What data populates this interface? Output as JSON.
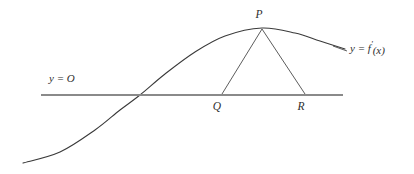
{
  "figure": {
    "title": "",
    "background_color": "#ffffff",
    "curve_color": "#3a3a3a",
    "axis_color": "#8a8a8a",
    "triangle_color": "#4a4a4a",
    "text_color": "#2e2e2e",
    "labels": {
      "axis_label": "y = O",
      "curve_label_lhs": "y = f",
      "curve_label_prime": "'",
      "curve_label_arg": "(x)",
      "curve_label_full": "y = f'(x)",
      "point_p": "P",
      "point_q": "Q",
      "point_r": "R"
    }
  },
  "chart_data": {
    "type": "line",
    "title": "",
    "xlabel": "",
    "ylabel": "",
    "grid": false,
    "legend": "none",
    "annotations": [
      {
        "name": "axis-label",
        "text": "y = O",
        "x": 49,
        "y": 82
      },
      {
        "name": "curve-label",
        "text": "y = f'(x)",
        "x": 350,
        "y": 52
      },
      {
        "name": "point-p-label",
        "text": "P",
        "x": 259,
        "y": 18
      },
      {
        "name": "point-q-label",
        "text": "Q",
        "x": 217,
        "y": 110
      },
      {
        "name": "point-r-label",
        "text": "R",
        "x": 301,
        "y": 110
      }
    ],
    "axis_line": {
      "x1": 41,
      "y1": 95,
      "x2": 343,
      "y2": 95
    },
    "curve_points": [
      {
        "x": 23,
        "y": 163
      },
      {
        "x": 60,
        "y": 152
      },
      {
        "x": 95,
        "y": 130
      },
      {
        "x": 120,
        "y": 110
      },
      {
        "x": 140,
        "y": 95
      },
      {
        "x": 165,
        "y": 74
      },
      {
        "x": 195,
        "y": 52
      },
      {
        "x": 225,
        "y": 36
      },
      {
        "x": 262,
        "y": 28
      },
      {
        "x": 295,
        "y": 33
      },
      {
        "x": 320,
        "y": 41
      },
      {
        "x": 345,
        "y": 49
      }
    ],
    "triangle": {
      "apex": {
        "label": "P",
        "x": 262,
        "y": 28
      },
      "foot_left": {
        "label": "Q",
        "x": 222,
        "y": 95
      },
      "foot_right": {
        "label": "R",
        "x": 305,
        "y": 95
      }
    },
    "leader_line": {
      "x1": 333,
      "y1": 46,
      "x2": 347,
      "y2": 51
    }
  }
}
